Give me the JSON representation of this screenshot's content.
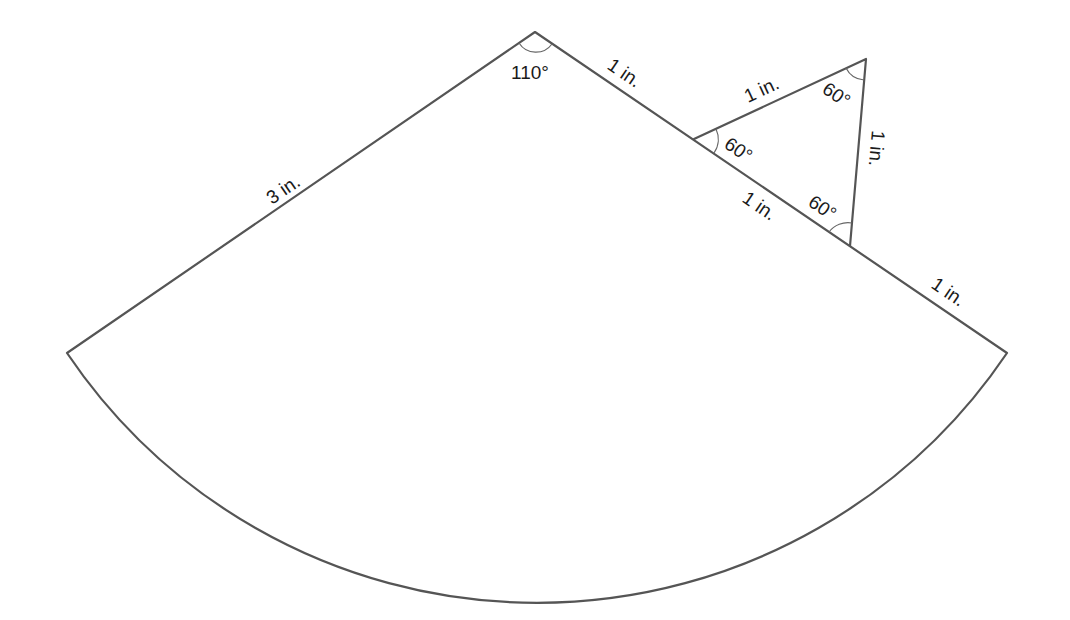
{
  "figure": {
    "colors": {
      "stroke": "#555555",
      "text": "#1a1a1a",
      "background": "#ffffff"
    },
    "sector": {
      "apex_angle": "110°",
      "left_side_label": "3 in.",
      "right_side_segment_labels": [
        "1 in.",
        "1 in.",
        "1 in."
      ]
    },
    "triangle": {
      "side_labels": {
        "top": "1 in.",
        "right": "1 in.",
        "shared": "1 in."
      },
      "angle_labels": {
        "left": "60°",
        "top": "60°",
        "bottom": "60°"
      }
    }
  }
}
